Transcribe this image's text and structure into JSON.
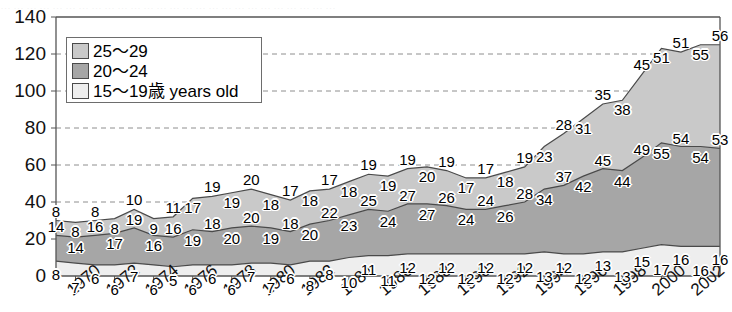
{
  "top_cut_text": "……………………………………………………………………",
  "legend": {
    "items": [
      {
        "label": "25～29",
        "color": "#c9c9c9",
        "name": "series-25-29"
      },
      {
        "label": "20～24",
        "color": "#a6a6a6",
        "name": "series-20-24"
      },
      {
        "label": "15～19歳 years old",
        "color": "#eeeeee",
        "name": "series-15-19"
      }
    ]
  },
  "axis": {
    "y_ticks": [
      "0",
      "20",
      "40",
      "60",
      "80",
      "100",
      "120",
      "140"
    ],
    "x_ticks": [
      "1970",
      "1972",
      "1974",
      "1976",
      "1978",
      "1980",
      "1982",
      "1984",
      "1986",
      "1988",
      "1990",
      "1992",
      "1994",
      "1996",
      "1998",
      "2000",
      "2002"
    ]
  },
  "chart_data": {
    "type": "area",
    "title": "",
    "xlabel": "",
    "ylabel": "",
    "ylim": [
      0,
      140
    ],
    "grid": true,
    "stacked": true,
    "legend_position": "top-left",
    "x": [
      1969,
      1970,
      1971,
      1972,
      1973,
      1974,
      1975,
      1976,
      1977,
      1978,
      1979,
      1980,
      1981,
      1982,
      1983,
      1984,
      1985,
      1986,
      1987,
      1988,
      1989,
      1990,
      1991,
      1992,
      1993,
      1994,
      1995,
      1996,
      1997,
      1998,
      1999,
      2000,
      2001,
      2002,
      2003
    ],
    "categories": [
      "1969",
      "1970",
      "1971",
      "1972",
      "1973",
      "1974",
      "1975",
      "1976",
      "1977",
      "1978",
      "1979",
      "1980",
      "1981",
      "1982",
      "1983",
      "1984",
      "1985",
      "1986",
      "1987",
      "1988",
      "1989",
      "1990",
      "1991",
      "1992",
      "1993",
      "1994",
      "1995",
      "1996",
      "1997",
      "1998",
      "1999",
      "2000",
      "2001",
      "2002",
      "2003"
    ],
    "series": [
      {
        "name": "15～19歳 years old",
        "color": "#eeeeee",
        "values": [
          8,
          7,
          6,
          6,
          7,
          6,
          5,
          6,
          6,
          6,
          7,
          7,
          6,
          8,
          8,
          10,
          11,
          11,
          12,
          12,
          12,
          12,
          12,
          12,
          12,
          13,
          12,
          12,
          13,
          13,
          15,
          17,
          16,
          16,
          16
        ]
      },
      {
        "name": "20～24",
        "color": "#a6a6a6",
        "values": [
          14,
          14,
          16,
          17,
          19,
          16,
          16,
          19,
          18,
          20,
          20,
          19,
          18,
          20,
          22,
          23,
          25,
          24,
          27,
          27,
          26,
          24,
          24,
          26,
          28,
          34,
          37,
          42,
          45,
          44,
          49,
          55,
          54,
          54,
          53
        ]
      },
      {
        "name": "25～29",
        "color": "#c9c9c9",
        "values": [
          8,
          8,
          8,
          8,
          10,
          9,
          11,
          17,
          19,
          19,
          20,
          18,
          17,
          18,
          17,
          18,
          19,
          19,
          19,
          20,
          19,
          17,
          17,
          18,
          19,
          23,
          28,
          31,
          35,
          38,
          45,
          51,
          51,
          55,
          56
        ]
      }
    ]
  }
}
